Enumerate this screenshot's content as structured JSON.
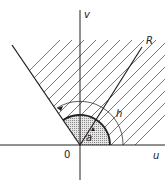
{
  "diagram": {
    "labels": {
      "v_axis": "v",
      "u_axis": "u",
      "origin": "0",
      "ray": "R",
      "outer_arc": "h",
      "inner_angle": "a"
    },
    "colors": {
      "ink": "#222222",
      "shade": "#bdbdbd",
      "hatch": "#555555"
    }
  }
}
